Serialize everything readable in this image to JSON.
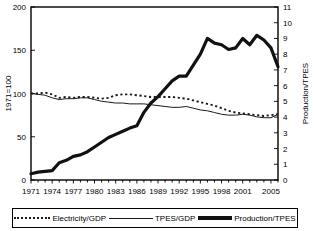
{
  "chart_data": {
    "type": "line",
    "title": "",
    "xlabel": "",
    "ylabel": "1971=100",
    "y2label": "Production/TPES",
    "grid": false,
    "legend_position": "bottom",
    "xlim": [
      1971,
      2006
    ],
    "ylim": [
      0,
      200
    ],
    "y2lim": [
      0,
      11
    ],
    "xticklabels": [
      "1971",
      "1974",
      "1977",
      "1980",
      "1983",
      "1986",
      "1989",
      "1992",
      "1995",
      "1998",
      "2001",
      "2005"
    ],
    "xticks": [
      1971,
      1974,
      1977,
      1980,
      1983,
      1986,
      1989,
      1992,
      1995,
      1998,
      2001,
      2005
    ],
    "yticklabels": [
      "0",
      "50",
      "100",
      "150",
      "200"
    ],
    "yticks": [
      0,
      50,
      100,
      150,
      200
    ],
    "y2ticklabels": [
      "0",
      "1",
      "2",
      "3",
      "4",
      "5",
      "6",
      "7",
      "8",
      "9",
      "10",
      "11"
    ],
    "y2ticks": [
      0,
      1,
      2,
      3,
      4,
      5,
      6,
      7,
      8,
      9,
      10,
      11
    ],
    "x": [
      1971,
      1972,
      1973,
      1974,
      1975,
      1976,
      1977,
      1978,
      1979,
      1980,
      1981,
      1982,
      1983,
      1984,
      1985,
      1986,
      1987,
      1988,
      1989,
      1990,
      1991,
      1992,
      1993,
      1994,
      1995,
      1996,
      1997,
      1998,
      1999,
      2000,
      2001,
      2002,
      2003,
      2004,
      2005,
      2006
    ],
    "series": [
      {
        "name": "Electricity/GDP",
        "axis": "left",
        "style": "dotted",
        "color": "#1a1a1a",
        "values": [
          100,
          100,
          101,
          99,
          95,
          96,
          95,
          96,
          96,
          95,
          94,
          95,
          98,
          99,
          99,
          98,
          97,
          96,
          96,
          96,
          96,
          95,
          94,
          92,
          90,
          88,
          86,
          83,
          80,
          78,
          77,
          76,
          75,
          74,
          75,
          76
        ]
      },
      {
        "name": "TPES/GDP",
        "axis": "left",
        "style": "solid-thin",
        "color": "#1a1a1a",
        "values": [
          100,
          99,
          98,
          95,
          93,
          94,
          94,
          95,
          95,
          93,
          91,
          90,
          89,
          89,
          88,
          88,
          88,
          87,
          86,
          85,
          84,
          84,
          85,
          83,
          81,
          80,
          78,
          76,
          75,
          75,
          76,
          75,
          73,
          72,
          72,
          76
        ]
      },
      {
        "name": "Production/TPES",
        "axis": "right",
        "style": "solid-thick",
        "color": "#111111",
        "values": [
          0.4,
          0.5,
          0.55,
          0.6,
          1.1,
          1.25,
          1.5,
          1.6,
          1.8,
          2.1,
          2.4,
          2.7,
          2.9,
          3.1,
          3.3,
          3.45,
          4.3,
          4.9,
          5.3,
          5.8,
          6.3,
          6.6,
          6.6,
          7.3,
          8.0,
          9.0,
          8.7,
          8.6,
          8.3,
          8.4,
          9.0,
          8.6,
          9.2,
          8.9,
          8.4,
          7.2
        ]
      }
    ]
  },
  "legend": {
    "items": [
      {
        "label": "Electricity/GDP",
        "style": "dotted"
      },
      {
        "label": "TPES/GDP",
        "style": "thin"
      },
      {
        "label": "Production/TPES",
        "style": "thick"
      }
    ]
  }
}
